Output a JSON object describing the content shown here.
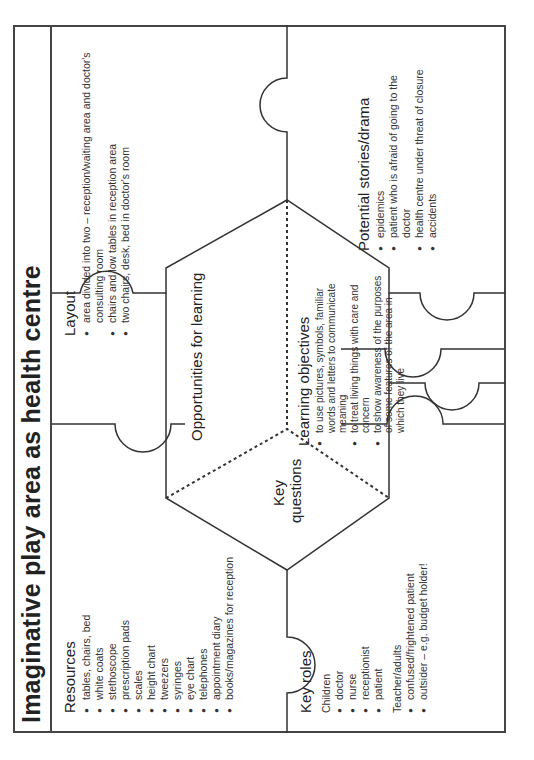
{
  "title": "Imaginative play area as health centre",
  "resources": {
    "heading": "Resources",
    "items": [
      "tables, chairs, bed",
      "white coats",
      "stethoscope",
      "prescription pads",
      "scales",
      "height chart",
      "tweezers",
      "syringes",
      "eye chart",
      "telephones",
      "appointment diary",
      "books/magazines for reception"
    ]
  },
  "layout": {
    "heading": "Layout",
    "items": [
      "area divided into two – reception/waiting area and doctor's consulting room",
      "chairs and low tables in reception area",
      "two chairs, desk, bed in doctor's room"
    ]
  },
  "key_roles": {
    "heading": "Key roles",
    "children_label": "Children",
    "children": [
      "doctor",
      "nurse",
      "receptionist",
      "patient"
    ],
    "adults_label": "Teacher/adults",
    "adults": [
      "confused/frightened patient",
      "outsider – e.g. budget holder!"
    ]
  },
  "potential_stories": {
    "heading": "Potential stories/drama",
    "items": [
      "epidemics",
      "patient who is afraid of going to the doctor",
      "health centre under threat of closure",
      "accidents"
    ]
  },
  "centre": {
    "opportunities": "Opportunities for learning",
    "key_questions_1": "Key",
    "key_questions_2": "questions",
    "learning_objectives": {
      "heading": "Learning objectives",
      "items": [
        "to use pictures, symbols, familiar words and letters to communicate meaning",
        "to treat living things with care and concern",
        "to show awareness of the purposes of some features of the area in which they live"
      ]
    }
  }
}
